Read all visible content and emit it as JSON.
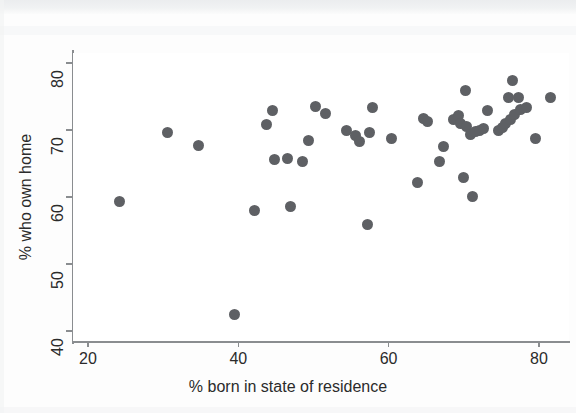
{
  "figure": {
    "background_color": "#fdfdfd",
    "plot_background_color": "#ffffff",
    "axis_color": "#8a8d90",
    "marker_color": "#5e6064"
  },
  "chart_data": {
    "type": "scatter",
    "title": "",
    "xlabel": "% born in state of residence",
    "ylabel": "% who own home",
    "xlim": [
      18,
      84
    ],
    "ylim": [
      38.5,
      81.5
    ],
    "xticks": [
      20,
      40,
      60,
      80
    ],
    "yticks": [
      40,
      50,
      60,
      70,
      80
    ],
    "xtick_labels": [
      "20",
      "40",
      "60",
      "80"
    ],
    "ytick_labels": [
      "40",
      "50",
      "60",
      "70",
      "80"
    ],
    "grid": false,
    "legend": null,
    "marker": "filled-circle",
    "marker_size_px": 11,
    "n_points": 50,
    "points": [
      [
        24.2,
        59.3
      ],
      [
        30.6,
        69.6
      ],
      [
        34.7,
        67.7
      ],
      [
        39.5,
        42.5
      ],
      [
        42.1,
        58.0
      ],
      [
        43.8,
        70.8
      ],
      [
        44.6,
        72.9
      ],
      [
        44.8,
        65.6
      ],
      [
        46.5,
        65.7
      ],
      [
        46.9,
        58.6
      ],
      [
        48.5,
        65.3
      ],
      [
        49.3,
        68.4
      ],
      [
        50.3,
        73.5
      ],
      [
        51.6,
        72.5
      ],
      [
        54.4,
        69.9
      ],
      [
        55.6,
        69.2
      ],
      [
        56.1,
        68.3
      ],
      [
        57.2,
        55.9
      ],
      [
        57.4,
        69.7
      ],
      [
        57.8,
        73.4
      ],
      [
        60.4,
        68.8
      ],
      [
        63.9,
        62.2
      ],
      [
        64.6,
        71.7
      ],
      [
        65.2,
        71.3
      ],
      [
        66.8,
        65.3
      ],
      [
        67.3,
        67.6
      ],
      [
        68.6,
        71.6
      ],
      [
        69.3,
        72.2
      ],
      [
        69.6,
        71.0
      ],
      [
        69.9,
        62.9
      ],
      [
        70.2,
        75.9
      ],
      [
        70.4,
        70.5
      ],
      [
        70.9,
        69.4
      ],
      [
        71.2,
        60.1
      ],
      [
        71.6,
        69.8
      ],
      [
        72.1,
        69.9
      ],
      [
        72.6,
        70.3
      ],
      [
        73.1,
        72.9
      ],
      [
        74.6,
        70.0
      ],
      [
        75.1,
        70.4
      ],
      [
        75.6,
        70.9
      ],
      [
        76.0,
        74.8
      ],
      [
        76.2,
        71.6
      ],
      [
        76.5,
        77.4
      ],
      [
        76.8,
        72.3
      ],
      [
        77.3,
        74.9
      ],
      [
        77.6,
        73.1
      ],
      [
        78.4,
        73.4
      ],
      [
        79.6,
        68.7
      ],
      [
        81.6,
        74.8
      ]
    ]
  }
}
